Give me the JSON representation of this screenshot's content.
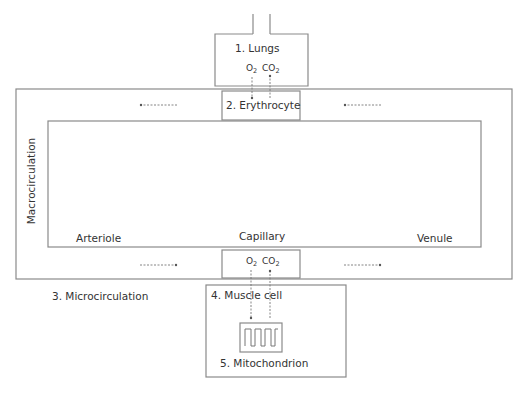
{
  "diagram": {
    "lungs": {
      "label": "1. Lungs"
    },
    "erythrocyte": {
      "label": "2. Erythrocyte"
    },
    "microcirculation": {
      "label": "3. Microcirculation"
    },
    "muscle_cell": {
      "label": "4. Muscle cell"
    },
    "mitochondrion": {
      "label": "5. Mitochondrion"
    },
    "macrocirculation": {
      "label": "Macrocirculation"
    },
    "vessels": {
      "arteriole": "Arteriole",
      "capillary": "Capillary",
      "venule": "Venule"
    },
    "gases": {
      "o2": "O",
      "o2_sub": "2",
      "co2": "CO",
      "co2_sub": "2"
    },
    "colors": {
      "line": "#8a8a8a",
      "text": "#333333"
    }
  }
}
